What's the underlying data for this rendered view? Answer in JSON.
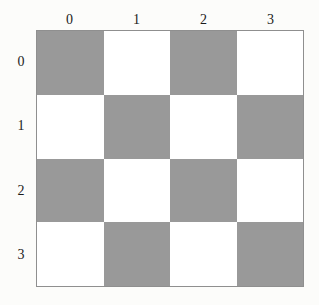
{
  "figure": {
    "kind": "checkerboard-grid",
    "rows": 4,
    "cols": 4,
    "shaded_color": "#999999",
    "light_color": "#ffffff",
    "border_color": "#8f8f8f",
    "page_background": "#fcfcfa"
  },
  "axes": {
    "column_labels": [
      "0",
      "1",
      "2",
      "3"
    ],
    "row_labels": [
      "0",
      "1",
      "2",
      "3"
    ]
  },
  "chart_data": {
    "type": "heatmap",
    "title": "",
    "xlabel": "",
    "ylabel": "",
    "categories": [
      "0",
      "1",
      "2",
      "3"
    ],
    "x": [
      "0",
      "1",
      "2",
      "3"
    ],
    "y": [
      "0",
      "1",
      "2",
      "3"
    ],
    "grid": true,
    "legend": "none",
    "colors": {
      "0": "#ffffff",
      "1": "#999999"
    },
    "note": "value 1 = shaded cell, value 0 = white cell; shaded where (row + col) is even",
    "values": [
      [
        1,
        0,
        1,
        0
      ],
      [
        0,
        1,
        0,
        1
      ],
      [
        1,
        0,
        1,
        0
      ],
      [
        0,
        1,
        0,
        1
      ]
    ]
  }
}
